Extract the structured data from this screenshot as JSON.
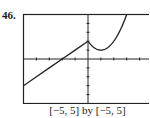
{
  "problem_number": "46.",
  "caption": "[−5, 5] by [−5, 5]",
  "chart_data": {
    "type": "line",
    "title": "",
    "xlabel": "",
    "ylabel": "",
    "xlim": [
      -5,
      5
    ],
    "ylim": [
      -5,
      5
    ],
    "grid": false,
    "ticks": {
      "x_step": 1,
      "y_step": 1
    },
    "legend": null,
    "series": [
      {
        "name": "left piece (linear)",
        "description": "y = x + 2 for x < 0",
        "x": [
          -5,
          -4,
          -3,
          -2,
          -1,
          0
        ],
        "y": [
          -3,
          -2,
          -1,
          0,
          1,
          2
        ]
      },
      {
        "name": "right piece (parabola)",
        "description": "y = (x - 1)^2 + 1 for x >= 0",
        "x": [
          0,
          0.5,
          1,
          1.5,
          2,
          2.5,
          3
        ],
        "y": [
          2,
          1.25,
          1,
          1.25,
          2,
          3.25,
          5
        ]
      }
    ],
    "annotations": [
      "cusp at (0, 2)"
    ]
  }
}
